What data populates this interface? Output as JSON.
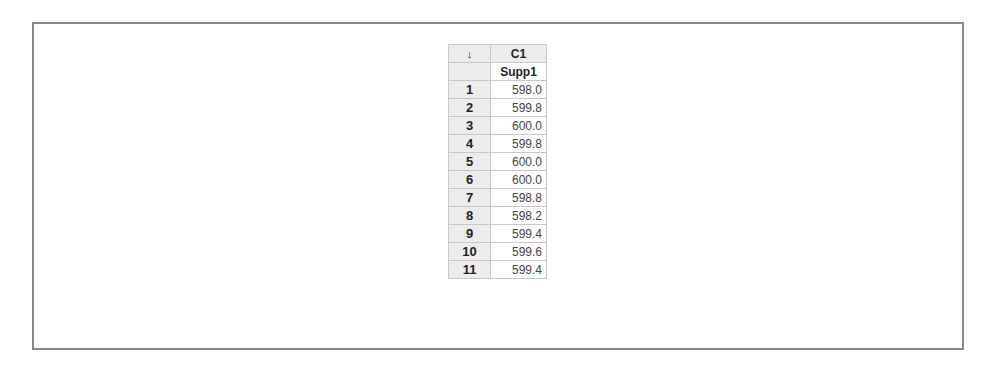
{
  "worksheet": {
    "corner_icon": "down-arrow-icon",
    "corner_glyph": "↓",
    "columns": [
      {
        "id": "C1",
        "name": "Supp1"
      }
    ],
    "rows": [
      {
        "index": "1",
        "values": [
          "598.0"
        ]
      },
      {
        "index": "2",
        "values": [
          "599.8"
        ]
      },
      {
        "index": "3",
        "values": [
          "600.0"
        ]
      },
      {
        "index": "4",
        "values": [
          "599.8"
        ]
      },
      {
        "index": "5",
        "values": [
          "600.0"
        ]
      },
      {
        "index": "6",
        "values": [
          "600.0"
        ]
      },
      {
        "index": "7",
        "values": [
          "598.8"
        ]
      },
      {
        "index": "8",
        "values": [
          "598.2"
        ]
      },
      {
        "index": "9",
        "values": [
          "599.4"
        ]
      },
      {
        "index": "10",
        "values": [
          "599.6"
        ]
      },
      {
        "index": "11",
        "values": [
          "599.4"
        ]
      }
    ]
  }
}
